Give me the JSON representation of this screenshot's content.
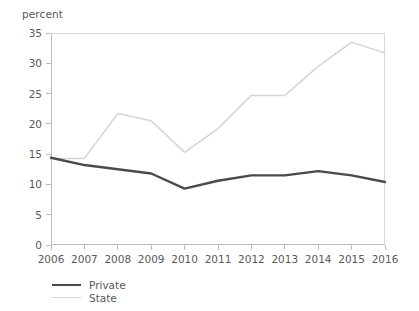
{
  "chart_data": {
    "type": "line",
    "title": "",
    "xlabel": "",
    "ylabel": "percent",
    "categories": [
      "2006",
      "2007",
      "2008",
      "2009",
      "2010",
      "2011",
      "2012",
      "2013",
      "2014",
      "2015",
      "2016"
    ],
    "x": [
      2006,
      2007,
      2008,
      2009,
      2010,
      2011,
      2012,
      2013,
      2014,
      2015,
      2016
    ],
    "series": [
      {
        "name": "Private",
        "color": "#4a4a4a",
        "values": [
          14.4,
          13.2,
          12.5,
          11.8,
          9.3,
          10.6,
          11.5,
          11.5,
          12.2,
          11.5,
          10.4
        ]
      },
      {
        "name": "State",
        "color": "#d5d5d5",
        "values": [
          14.3,
          14.3,
          21.7,
          20.5,
          15.3,
          19.2,
          24.7,
          24.7,
          29.5,
          33.5,
          31.7
        ]
      }
    ],
    "ylim": [
      0,
      35
    ],
    "yticks": [
      0,
      5,
      10,
      15,
      20,
      25,
      30,
      35
    ],
    "ytick_labels": [
      "0",
      "5",
      "10",
      "15",
      "20",
      "25",
      "30",
      "35"
    ],
    "xlim": [
      2006,
      2016
    ],
    "grid": false,
    "legend_position": "bottom-left"
  },
  "axis": {
    "unit_label": "percent"
  },
  "legend": {
    "entries": [
      {
        "label": "Private"
      },
      {
        "label": "State"
      }
    ]
  }
}
